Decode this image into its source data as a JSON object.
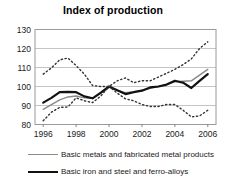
{
  "chart_data": {
    "type": "line",
    "title": "Index of production",
    "xlabel": "",
    "ylabel": "",
    "xlim": [
      1995.5,
      2006.5
    ],
    "ylim": [
      80,
      130
    ],
    "yticks": [
      80,
      90,
      100,
      110,
      120,
      130
    ],
    "xticks": [
      1996,
      1998,
      2000,
      2002,
      2004,
      2006
    ],
    "grid": "horizontal",
    "legend_position": "below",
    "x": [
      1996,
      1996.5,
      1997,
      1997.5,
      1998,
      1998.5,
      1999,
      1999.5,
      2000,
      2000.5,
      2001,
      2001.5,
      2002,
      2002.5,
      2003,
      2003.5,
      2004,
      2004.5,
      2005,
      2005.5,
      2006
    ],
    "series": [
      {
        "name": "Basic metals and fabricated metal products",
        "style": "solid",
        "color": "#8a8a8a",
        "width": 1.4,
        "values": [
          88.0,
          90.5,
          93.0,
          94.5,
          95.0,
          94.0,
          93.8,
          96.5,
          99.5,
          98.0,
          96.8,
          97.2,
          98.0,
          99.0,
          100.0,
          101.0,
          102.5,
          102.8,
          103.0,
          106.0,
          109.0
        ]
      },
      {
        "name": "Basic iron and steel and ferro-alloys",
        "style": "solid",
        "color": "#111111",
        "width": 2.2,
        "values": [
          91.5,
          94.0,
          97.0,
          97.2,
          97.0,
          94.8,
          93.8,
          96.8,
          100.0,
          98.0,
          96.0,
          97.0,
          97.8,
          99.5,
          100.0,
          101.0,
          103.0,
          102.0,
          99.2,
          103.0,
          106.5
        ]
      },
      {
        "name": "upper-dotted-series",
        "style": "dotted",
        "color": "#333333",
        "width": 1.4,
        "values": [
          106.5,
          109.8,
          114.0,
          115.0,
          111.0,
          106.5,
          100.5,
          100.0,
          100.0,
          103.0,
          104.5,
          102.0,
          103.0,
          103.0,
          105.0,
          107.0,
          109.0,
          111.5,
          114.5,
          120.0,
          123.5
        ]
      },
      {
        "name": "lower-dotted-series",
        "style": "dotted",
        "color": "#333333",
        "width": 1.4,
        "values": [
          82.0,
          86.5,
          89.0,
          89.2,
          94.0,
          92.5,
          91.5,
          95.0,
          100.0,
          96.5,
          93.5,
          92.5,
          90.5,
          89.5,
          89.5,
          90.5,
          90.5,
          87.5,
          84.0,
          84.5,
          87.5
        ]
      }
    ]
  },
  "legend": {
    "items": [
      {
        "label": "Basic metals and fabricated metal products",
        "color": "#8a8a8a"
      },
      {
        "label": "Basic iron and steel and ferro-alloys",
        "color": "#111111"
      }
    ]
  },
  "axis": {
    "y_tick_labels": [
      "130",
      "120",
      "110",
      "100",
      "90",
      "80"
    ],
    "x_tick_labels": [
      "1996",
      "1998",
      "2000",
      "2002",
      "2004",
      "2006"
    ]
  }
}
